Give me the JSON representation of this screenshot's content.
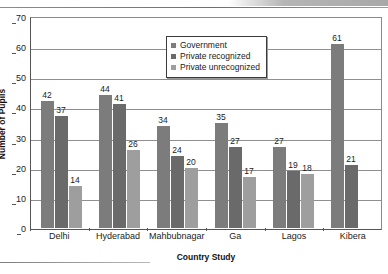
{
  "chart_data": {
    "type": "bar",
    "title": "",
    "xlabel": "Country Study",
    "ylabel": "Number of Pupils",
    "ylim": [
      0,
      70
    ],
    "ytick_step": 10,
    "yticks": [
      0,
      10,
      20,
      30,
      40,
      50,
      60,
      70
    ],
    "grid": true,
    "legend_position": "top-center",
    "categories": [
      "Delhi",
      "Hyderabad",
      "Mahbubnagar",
      "Ga",
      "Lagos",
      "Kibera"
    ],
    "series": [
      {
        "name": "Government",
        "color": "#7c7c7c",
        "values": [
          42,
          44,
          34,
          35,
          27,
          61
        ]
      },
      {
        "name": "Private recognized",
        "color": "#6a6a6a",
        "values": [
          37,
          41,
          24,
          27,
          19,
          21
        ]
      },
      {
        "name": "Private unrecognized",
        "color": "#9e9e9e",
        "values": [
          14,
          26,
          20,
          17,
          18,
          null
        ]
      }
    ]
  },
  "colors": {
    "government": "#7c7c7c",
    "private_recognized": "#6a6a6a",
    "private_unrecognized": "#9e9e9e",
    "axis": "#555555",
    "grid": "#8f8f8f",
    "background": "#ffffff"
  }
}
